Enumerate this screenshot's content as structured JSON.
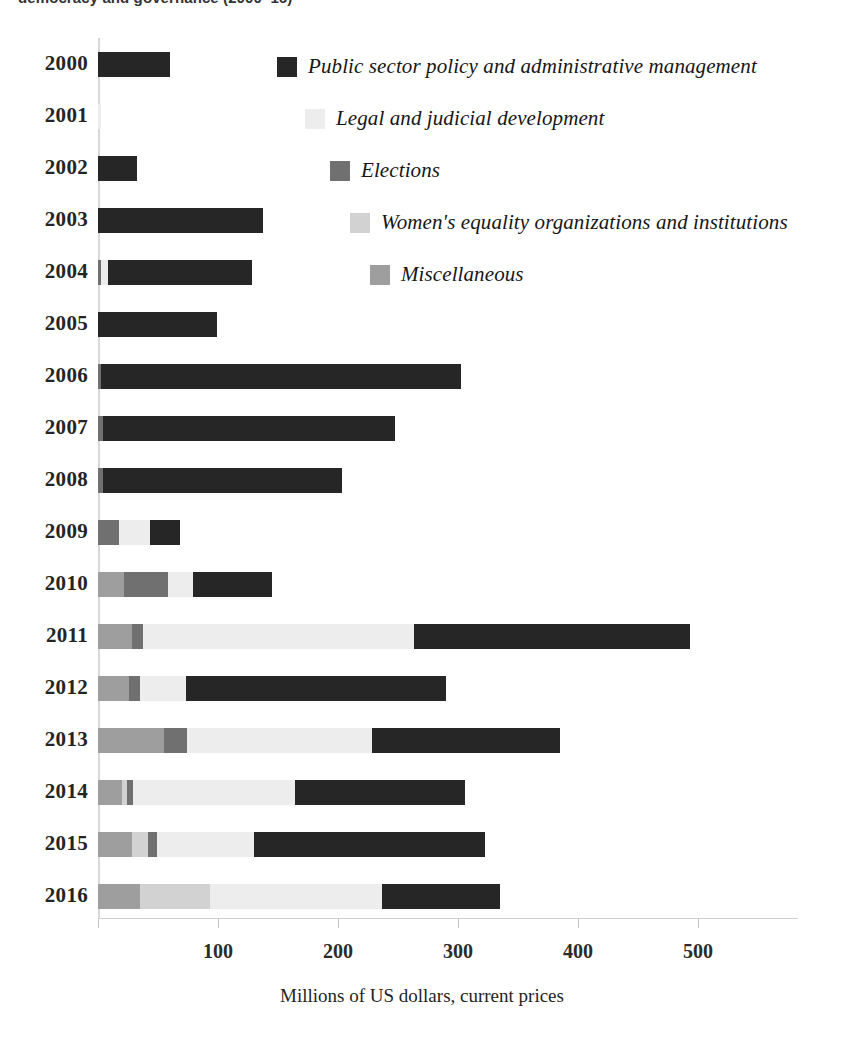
{
  "title": "democracy and governance (2000–16)",
  "chart_data": {
    "type": "bar",
    "orientation": "horizontal",
    "stacked": true,
    "title": "democracy and governance (2000–16)",
    "xlabel": "Millions of US dollars, current prices",
    "ylabel": "",
    "xlim": [
      0,
      580
    ],
    "xticks": [
      0,
      100,
      200,
      300,
      400,
      500
    ],
    "xtick_labels": [
      "",
      "100",
      "200",
      "300",
      "400",
      "500"
    ],
    "grid": false,
    "legend_position": "upper-right-inside",
    "categories": [
      "2000",
      "2001",
      "2002",
      "2003",
      "2004",
      "2005",
      "2006",
      "2007",
      "2008",
      "2009",
      "2010",
      "2011",
      "2012",
      "2013",
      "2014",
      "2015",
      "2016"
    ],
    "series": [
      {
        "name": "Miscellaneous",
        "color": "#9e9e9e",
        "values": [
          0,
          0,
          0,
          0,
          0,
          0,
          0,
          0,
          0,
          0,
          22,
          28,
          26,
          55,
          20,
          28,
          35
        ]
      },
      {
        "name": "Women's equality organizations and institutions",
        "color": "#d2d2d2",
        "values": [
          0,
          0,
          0,
          0,
          0,
          0,
          0,
          0,
          0,
          0,
          0,
          0,
          0,
          0,
          4,
          13,
          23
        ]
      },
      {
        "name": "Elections",
        "color": "#707070",
        "values": [
          0,
          0,
          0,
          0,
          2,
          0,
          2,
          3,
          3,
          17,
          14,
          9,
          9,
          19,
          5,
          8,
          0
        ]
      },
      {
        "name": "Legal and judicial development",
        "color": "#ededed",
        "values": [
          0,
          2,
          0,
          0,
          6,
          0,
          0,
          0,
          0,
          26,
          21,
          226,
          38,
          154,
          135,
          88,
          143
        ]
      },
      {
        "name": "Public sector policy and administrative management",
        "color": "#262626",
        "values": [
          59,
          0,
          32,
          137,
          120,
          99,
          299,
          244,
          200,
          25,
          88,
          232,
          217,
          157,
          142,
          193,
          80
        ]
      }
    ],
    "totals": [
      59,
      2,
      32,
      137,
      128,
      99,
      301,
      247,
      203,
      68,
      145,
      495,
      290,
      385,
      306,
      330,
      281
    ],
    "legend_entries": [
      "Public sector policy and administrative management",
      "Legal and judicial development",
      "Elections",
      "Women's equality organizations and institutions",
      "Miscellaneous"
    ]
  },
  "axis": {
    "x_title": "Millions of US dollars, current prices",
    "tick_labels": [
      "100",
      "200",
      "300",
      "400",
      "500"
    ]
  },
  "legend": [
    {
      "label": "Public sector policy and administrative management",
      "color": "#262626",
      "left": 277,
      "top": 54
    },
    {
      "label": "Legal and judicial development",
      "color": "#ededed",
      "left": 305,
      "top": 106
    },
    {
      "label": "Elections",
      "color": "#707070",
      "left": 330,
      "top": 158
    },
    {
      "label": "Women's equality organizations and institutions",
      "color": "#d2d2d2",
      "left": 350,
      "top": 210
    },
    {
      "label": "Miscellaneous",
      "color": "#9e9e9e",
      "left": 370,
      "top": 262
    }
  ],
  "rows": [
    {
      "year": "2000",
      "top": 43,
      "segments": [
        {
          "series": "Public sector policy and administrative management",
          "color": "#262626",
          "x": 0,
          "w": 72
        }
      ]
    },
    {
      "year": "2001",
      "top": 95,
      "segments": [
        {
          "series": "Legal and judicial development",
          "color": "#ededed",
          "x": 0,
          "w": 3
        }
      ]
    },
    {
      "year": "2002",
      "top": 147,
      "segments": [
        {
          "series": "Public sector policy and administrative management",
          "color": "#262626",
          "x": 0,
          "w": 39
        }
      ]
    },
    {
      "year": "2003",
      "top": 199,
      "segments": [
        {
          "series": "Public sector policy and administrative management",
          "color": "#262626",
          "x": 0,
          "w": 165
        }
      ]
    },
    {
      "year": "2004",
      "top": 251,
      "segments": [
        {
          "series": "Elections",
          "color": "#707070",
          "x": 0,
          "w": 3
        },
        {
          "series": "Legal and judicial development",
          "color": "#ededed",
          "x": 3,
          "w": 7
        },
        {
          "series": "Public sector policy and administrative management",
          "color": "#262626",
          "x": 10,
          "w": 144
        }
      ]
    },
    {
      "year": "2005",
      "top": 303,
      "segments": [
        {
          "series": "Public sector policy and administrative management",
          "color": "#262626",
          "x": 0,
          "w": 119
        }
      ]
    },
    {
      "year": "2006",
      "top": 355,
      "segments": [
        {
          "series": "Elections",
          "color": "#707070",
          "x": 0,
          "w": 3
        },
        {
          "series": "Public sector policy and administrative management",
          "color": "#262626",
          "x": 3,
          "w": 360
        }
      ]
    },
    {
      "year": "2007",
      "top": 407,
      "segments": [
        {
          "series": "Elections",
          "color": "#707070",
          "x": 0,
          "w": 5
        },
        {
          "series": "Public sector policy and administrative management",
          "color": "#262626",
          "x": 5,
          "w": 292
        }
      ]
    },
    {
      "year": "2008",
      "top": 459,
      "segments": [
        {
          "series": "Elections",
          "color": "#707070",
          "x": 0,
          "w": 5
        },
        {
          "series": "Public sector policy and administrative management",
          "color": "#262626",
          "x": 5,
          "w": 239
        }
      ]
    },
    {
      "year": "2009",
      "top": 511,
      "segments": [
        {
          "series": "Elections",
          "color": "#707070",
          "x": 0,
          "w": 21
        },
        {
          "series": "Legal and judicial development",
          "color": "#ededed",
          "x": 21,
          "w": 31
        },
        {
          "series": "Public sector policy and administrative management",
          "color": "#262626",
          "x": 52,
          "w": 30
        }
      ]
    },
    {
      "year": "2010",
      "top": 563,
      "segments": [
        {
          "series": "Miscellaneous",
          "color": "#9e9e9e",
          "x": 0,
          "w": 26
        },
        {
          "series": "Elections",
          "color": "#707070",
          "x": 26,
          "w": 44
        },
        {
          "series": "Legal and judicial development",
          "color": "#ededed",
          "x": 70,
          "w": 25
        },
        {
          "series": "Public sector policy and administrative management",
          "color": "#262626",
          "x": 95,
          "w": 79
        }
      ]
    },
    {
      "year": "2011",
      "top": 615,
      "segments": [
        {
          "series": "Miscellaneous",
          "color": "#9e9e9e",
          "x": 0,
          "w": 34
        },
        {
          "series": "Elections",
          "color": "#707070",
          "x": 34,
          "w": 11
        },
        {
          "series": "Legal and judicial development",
          "color": "#ededed",
          "x": 45,
          "w": 271
        },
        {
          "series": "Public sector policy and administrative management",
          "color": "#262626",
          "x": 316,
          "w": 276
        }
      ]
    },
    {
      "year": "2012",
      "top": 667,
      "segments": [
        {
          "series": "Miscellaneous",
          "color": "#9e9e9e",
          "x": 0,
          "w": 31
        },
        {
          "series": "Elections",
          "color": "#707070",
          "x": 31,
          "w": 11
        },
        {
          "series": "Legal and judicial development",
          "color": "#ededed",
          "x": 42,
          "w": 46
        },
        {
          "series": "Public sector policy and administrative management",
          "color": "#262626",
          "x": 88,
          "w": 260
        }
      ]
    },
    {
      "year": "2013",
      "top": 719,
      "segments": [
        {
          "series": "Miscellaneous",
          "color": "#9e9e9e",
          "x": 0,
          "w": 66
        },
        {
          "series": "Elections",
          "color": "#707070",
          "x": 66,
          "w": 23
        },
        {
          "series": "Legal and judicial development",
          "color": "#ededed",
          "x": 89,
          "w": 185
        },
        {
          "series": "Public sector policy and administrative management",
          "color": "#262626",
          "x": 274,
          "w": 188
        }
      ]
    },
    {
      "year": "2014",
      "top": 771,
      "segments": [
        {
          "series": "Miscellaneous",
          "color": "#9e9e9e",
          "x": 0,
          "w": 24
        },
        {
          "series": "Women's equality organizations and institutions",
          "color": "#d2d2d2",
          "x": 24,
          "w": 5
        },
        {
          "series": "Elections",
          "color": "#707070",
          "x": 29,
          "w": 6
        },
        {
          "series": "Legal and judicial development",
          "color": "#ededed",
          "x": 35,
          "w": 162
        },
        {
          "series": "Public sector policy and administrative management",
          "color": "#262626",
          "x": 197,
          "w": 170
        }
      ]
    },
    {
      "year": "2015",
      "top": 823,
      "segments": [
        {
          "series": "Miscellaneous",
          "color": "#9e9e9e",
          "x": 0,
          "w": 34
        },
        {
          "series": "Women's equality organizations and institutions",
          "color": "#d2d2d2",
          "x": 34,
          "w": 16
        },
        {
          "series": "Elections",
          "color": "#707070",
          "x": 50,
          "w": 9
        },
        {
          "series": "Legal and judicial development",
          "color": "#ededed",
          "x": 59,
          "w": 97
        },
        {
          "series": "Public sector policy and administrative management",
          "color": "#262626",
          "x": 156,
          "w": 231
        }
      ]
    },
    {
      "year": "2016",
      "top": 875,
      "segments": [
        {
          "series": "Miscellaneous",
          "color": "#9e9e9e",
          "x": 0,
          "w": 42
        },
        {
          "series": "Women's equality organizations and institutions",
          "color": "#d2d2d2",
          "x": 42,
          "w": 70
        },
        {
          "series": "Legal and judicial development",
          "color": "#ededed",
          "x": 112,
          "w": 172
        },
        {
          "series": "Public sector policy and administrative management",
          "color": "#262626",
          "x": 284,
          "w": 118
        }
      ]
    }
  ],
  "ticks": [
    {
      "label": "100",
      "x": 218
    },
    {
      "label": "200",
      "x": 338
    },
    {
      "label": "300",
      "x": 458
    },
    {
      "label": "400",
      "x": 578
    },
    {
      "label": "500",
      "x": 698
    }
  ]
}
